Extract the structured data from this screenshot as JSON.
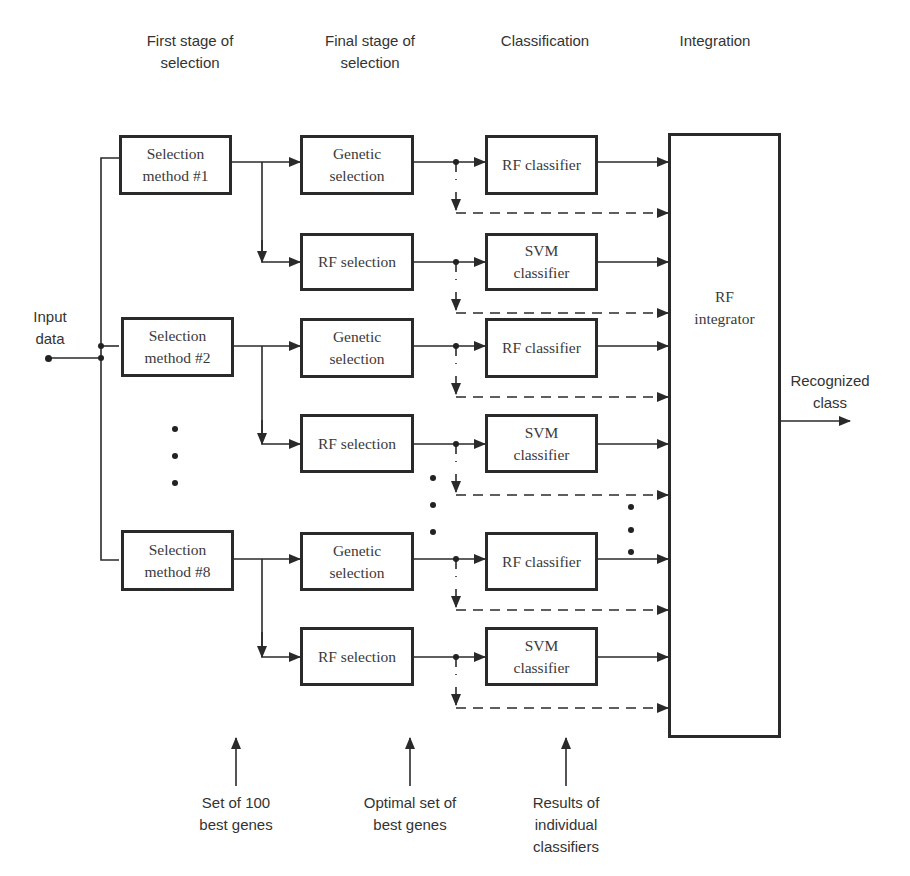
{
  "headers": {
    "first_stage": "First stage of\nselection",
    "final_stage": "Final stage of\nselection",
    "classification": "Classification",
    "integration": "Integration"
  },
  "input_label": "Input\ndata",
  "output_label": "Recognized\nclass",
  "selection_methods": [
    {
      "label": "Selection\nmethod #1"
    },
    {
      "label": "Selection\nmethod #2"
    },
    {
      "label": "Selection\nmethod #8"
    }
  ],
  "branches": [
    {
      "selector": "Genetic\nselection",
      "classifier": "RF classifier"
    },
    {
      "selector": "RF selection",
      "classifier": "SVM\nclassifier"
    },
    {
      "selector": "Genetic\nselection",
      "classifier": "RF classifier"
    },
    {
      "selector": "RF selection",
      "classifier": "SVM\nclassifier"
    },
    {
      "selector": "Genetic\nselection",
      "classifier": "RF classifier"
    },
    {
      "selector": "RF selection",
      "classifier": "SVM\nclassifier"
    }
  ],
  "integrator_label": "RF\nintegrator",
  "bottom_notes": {
    "genes_100": "Set of 100\nbest genes",
    "optimal_set": "Optimal set of\nbest genes",
    "results": "Results of\nindividual\nclassifiers"
  },
  "colors": {
    "line": "#2a2a2a",
    "text": "#333333",
    "background": "#ffffff"
  }
}
